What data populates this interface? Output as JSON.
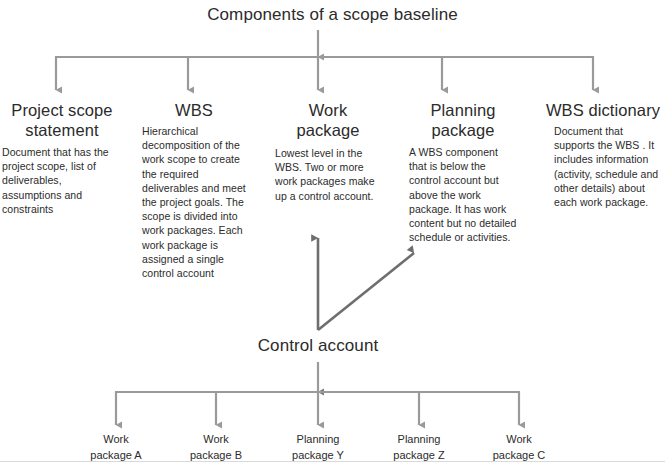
{
  "title": "Components of a scope baseline",
  "columns": [
    {
      "heading": "Project scope statement",
      "body": "Document that has the project scope, list of deliverables, assumptions and constraints"
    },
    {
      "heading": "WBS",
      "body": "Hierarchical decomposition of the work scope to create the required deliverables and meet the project goals. The scope is divided into work packages. Each work package is assigned a single control account"
    },
    {
      "heading": "Work package",
      "body": "Lowest level in the WBS. Two or more work packages make up a control account."
    },
    {
      "heading": "Planning package",
      "body": "A WBS component that is below the control account but above the work package. It has work content but no detailed schedule or activities."
    },
    {
      "heading": "WBS dictionary",
      "body": "Document that supports the WBS . It includes information (activity, schedule and other details) about each work package."
    }
  ],
  "control_account": {
    "label": "Control account"
  },
  "leaves": [
    {
      "line1": "Work",
      "line2": "package A"
    },
    {
      "line1": "Work",
      "line2": "package B"
    },
    {
      "line1": "Planning",
      "line2": "package Y"
    },
    {
      "line1": "Planning",
      "line2": "package Z"
    },
    {
      "line1": "Work",
      "line2": "package C"
    }
  ],
  "colors": {
    "connector": "#9a9a9a",
    "control_connector": "#6e6e6e",
    "text": "#2b2b2b",
    "background": "#ffffff",
    "page_rule": "#d9d9d9"
  }
}
